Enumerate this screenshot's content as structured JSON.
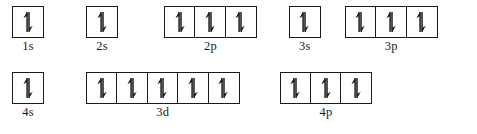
{
  "diagram": {
    "colors": {
      "background": "#ffffff",
      "box_border": "#1a1a1a",
      "arrow": "#1a1a1a",
      "label_text": "#1a1a1a"
    },
    "electron_icon": "paired-electron-arrows",
    "rows": [
      {
        "row_name": "row-1",
        "groups": [
          {
            "label": "1s",
            "boxes": 1,
            "electrons_per_box": [
              2
            ],
            "spins_per_box": [
              [
                "up",
                "down"
              ]
            ],
            "offset_left": 12,
            "gap_after": 42
          },
          {
            "label": "2s",
            "boxes": 1,
            "electrons_per_box": [
              2
            ],
            "spins_per_box": [
              [
                "up",
                "down"
              ]
            ],
            "offset_left": 0,
            "gap_after": 46
          },
          {
            "label": "2p",
            "boxes": 3,
            "electrons_per_box": [
              2,
              2,
              2
            ],
            "spins_per_box": [
              [
                "up",
                "down"
              ],
              [
                "up",
                "down"
              ],
              [
                "up",
                "down"
              ]
            ],
            "offset_left": 0,
            "gap_after": 32
          },
          {
            "label": "3s",
            "boxes": 1,
            "electrons_per_box": [
              2
            ],
            "spins_per_box": [
              [
                "up",
                "down"
              ]
            ],
            "offset_left": 0,
            "gap_after": 24
          },
          {
            "label": "3p",
            "boxes": 3,
            "electrons_per_box": [
              2,
              2,
              2
            ],
            "spins_per_box": [
              [
                "up",
                "down"
              ],
              [
                "up",
                "down"
              ],
              [
                "up",
                "down"
              ]
            ],
            "offset_left": 0,
            "gap_after": 0
          }
        ]
      },
      {
        "row_name": "row-2",
        "groups": [
          {
            "label": "4s",
            "boxes": 1,
            "electrons_per_box": [
              2
            ],
            "spins_per_box": [
              [
                "up",
                "down"
              ]
            ],
            "offset_left": 12,
            "gap_after": 42
          },
          {
            "label": "3d",
            "boxes": 5,
            "electrons_per_box": [
              2,
              2,
              2,
              2,
              2
            ],
            "spins_per_box": [
              [
                "up",
                "down"
              ],
              [
                "up",
                "down"
              ],
              [
                "up",
                "down"
              ],
              [
                "up",
                "down"
              ],
              [
                "up",
                "down"
              ]
            ],
            "offset_left": 0,
            "gap_after": 40
          },
          {
            "label": "4p",
            "boxes": 3,
            "electrons_per_box": [
              2,
              2,
              2
            ],
            "spins_per_box": [
              [
                "up",
                "down"
              ],
              [
                "up",
                "down"
              ],
              [
                "up",
                "down"
              ]
            ],
            "offset_left": 0,
            "gap_after": 0
          }
        ]
      }
    ]
  }
}
